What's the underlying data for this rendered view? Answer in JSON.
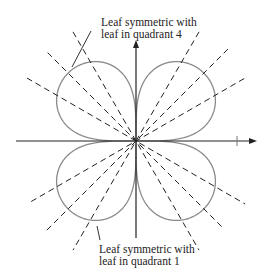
{
  "diagram": {
    "type": "polar-curve",
    "origin": [
      136,
      141
    ],
    "axes": {
      "x": {
        "from": 16,
        "to": 257,
        "tick_at": 237,
        "arrow": "right"
      },
      "y": {
        "from": 238,
        "to": 40,
        "arrow": "up"
      }
    },
    "leaf_radius": 96,
    "leaf_exponent": 0.35,
    "leaf_color": "#8a8a8a",
    "axis_color": "#222222",
    "dash_color": "#222222",
    "dashed_lines_deg": [
      30,
      45,
      60,
      120,
      135,
      150
    ],
    "dashed_half_lengths": [
      [
        125,
        125
      ],
      [
        130,
        130
      ],
      [
        126,
        126
      ],
      [
        126,
        126
      ],
      [
        125,
        125
      ],
      [
        126,
        126
      ]
    ],
    "annotations": [
      {
        "id": "top",
        "lines": [
          "Leaf symmetric with",
          "leaf in quadrant 4"
        ],
        "position": [
          101,
          16
        ],
        "leader": [
          [
            91,
            31
          ],
          [
            72,
            67
          ]
        ]
      },
      {
        "id": "bottom",
        "lines": [
          "Leaf symmetric with",
          "leaf in quadrant 1"
        ],
        "position": [
          99,
          243
        ],
        "leader": [
          [
            100,
            240
          ],
          [
            97,
            226
          ]
        ]
      }
    ]
  }
}
